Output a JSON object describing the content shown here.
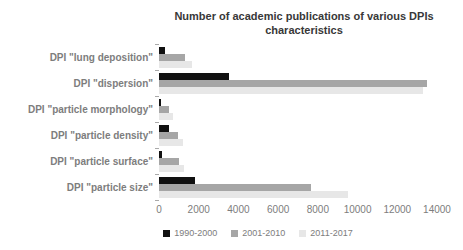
{
  "chart_data": {
    "type": "bar",
    "orientation": "horizontal",
    "title": "Number of academic publications of various DPIs characteristics",
    "categories": [
      "DPI \"lung deposition\"",
      "DPI \"dispersion\"",
      "DPI \"particle morphology\"",
      "DPI \"particle density\"",
      "DPI \"particle surface\"",
      "DPI \"particle size\""
    ],
    "series": [
      {
        "name": "1990-2000",
        "color": "#111111",
        "values": [
          300,
          3550,
          100,
          500,
          150,
          1800
        ]
      },
      {
        "name": "2001-2010",
        "color": "#a6a6a6",
        "values": [
          1300,
          13500,
          500,
          950,
          1000,
          7650
        ]
      },
      {
        "name": "2011-2017",
        "color": "#e7e7e7",
        "values": [
          1650,
          13300,
          700,
          1200,
          1250,
          9500
        ]
      }
    ],
    "xlabel": "",
    "ylabel": "",
    "xlim": [
      0,
      14000
    ],
    "x_ticks": [
      0,
      2000,
      4000,
      6000,
      8000,
      10000,
      12000,
      14000
    ],
    "grid": false,
    "legend_position": "bottom"
  },
  "colors": {
    "background": "#ffffff",
    "title_text": "#383838",
    "axis_text": "#7d7d7d",
    "category_text": "#7d7d7d",
    "tick_mark": "#a9a9a9"
  }
}
